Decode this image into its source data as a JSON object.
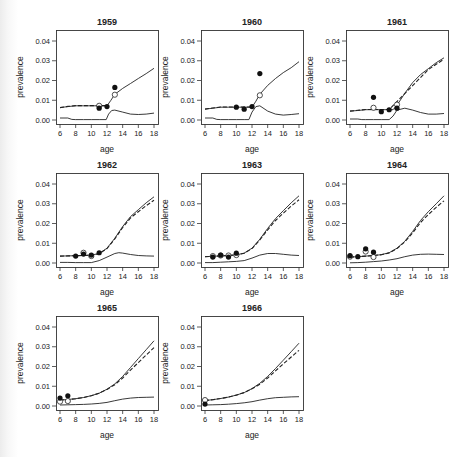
{
  "figure": {
    "xlabel": "age",
    "ylabel": "prevalence",
    "x_ticks": [
      6,
      8,
      10,
      12,
      14,
      16,
      18
    ],
    "y_ticks": [
      "0.00",
      "0.01",
      "0.02",
      "0.03",
      "0.04"
    ],
    "xlim": [
      6,
      18
    ],
    "ylim": [
      0,
      0.04
    ]
  },
  "chart_data": [
    {
      "type": "line",
      "title": "1959",
      "series": [
        {
          "name": "model upper solid",
          "style": "solid",
          "x": [
            6,
            7,
            8,
            9,
            10,
            11,
            12,
            12.5,
            13,
            14,
            15,
            16,
            17,
            18
          ],
          "y": [
            0.0063,
            0.0068,
            0.0072,
            0.0072,
            0.0072,
            0.0072,
            0.0072,
            0.01,
            0.013,
            0.016,
            0.0185,
            0.021,
            0.0235,
            0.0262
          ]
        },
        {
          "name": "model upper dashed",
          "style": "dashed",
          "x": [
            6,
            7,
            8,
            9,
            10,
            11,
            12
          ],
          "y": [
            0.0063,
            0.0069,
            0.0073,
            0.0073,
            0.0073,
            0.0073,
            0.0073
          ]
        },
        {
          "name": "model lower solid",
          "style": "solid",
          "x": [
            6,
            7,
            7.5,
            8,
            9,
            10,
            11,
            11.9,
            12.2,
            12.6,
            13,
            14,
            15,
            16,
            17,
            18
          ],
          "y": [
            0.001,
            0.001,
            0.0003,
            0.0002,
            0.0002,
            0.0002,
            0.0002,
            0.0002,
            0.003,
            0.0048,
            0.005,
            0.004,
            0.003,
            0.0028,
            0.003,
            0.0035
          ]
        },
        {
          "name": "observed filled",
          "style": "filled",
          "x": [
            11,
            12,
            13
          ],
          "y": [
            0.006,
            0.0068,
            0.0165
          ]
        },
        {
          "name": "observed open",
          "style": "open",
          "x": [
            11,
            13
          ],
          "y": [
            0.0072,
            0.0128
          ]
        }
      ]
    },
    {
      "type": "line",
      "title": "1960",
      "series": [
        {
          "name": "model upper solid",
          "style": "solid",
          "x": [
            6,
            7,
            8,
            9,
            10,
            11,
            12,
            12.5,
            13,
            14,
            15,
            16,
            17,
            18
          ],
          "y": [
            0.0055,
            0.006,
            0.0065,
            0.0065,
            0.0065,
            0.0065,
            0.0065,
            0.0095,
            0.013,
            0.0175,
            0.021,
            0.024,
            0.0265,
            0.0295
          ]
        },
        {
          "name": "model upper dashed",
          "style": "dashed",
          "x": [
            6,
            7,
            8,
            9,
            10,
            11,
            12
          ],
          "y": [
            0.0055,
            0.0061,
            0.0066,
            0.0066,
            0.0066,
            0.0066,
            0.0066
          ]
        },
        {
          "name": "model lower solid",
          "style": "solid",
          "x": [
            6,
            7,
            7.5,
            8,
            9,
            10,
            11,
            11.6,
            12,
            12.5,
            13,
            14,
            15,
            16,
            17,
            18
          ],
          "y": [
            0.001,
            0.001,
            0.0003,
            0.0002,
            0.0002,
            0.0002,
            0.0002,
            0.0002,
            0.004,
            0.0068,
            0.0072,
            0.0045,
            0.003,
            0.0025,
            0.0028,
            0.0032
          ]
        },
        {
          "name": "observed filled",
          "style": "filled",
          "x": [
            10,
            11,
            12,
            13
          ],
          "y": [
            0.0065,
            0.0055,
            0.0068,
            0.0235
          ]
        },
        {
          "name": "observed open",
          "style": "open",
          "x": [
            13
          ],
          "y": [
            0.0125
          ]
        }
      ]
    },
    {
      "type": "line",
      "title": "1961",
      "series": [
        {
          "name": "model upper solid",
          "style": "solid",
          "x": [
            6,
            7,
            8,
            9,
            10,
            11,
            11.5,
            12,
            13,
            14,
            15,
            16,
            17,
            18
          ],
          "y": [
            0.0045,
            0.0048,
            0.0052,
            0.0052,
            0.0052,
            0.0052,
            0.0052,
            0.0075,
            0.0135,
            0.019,
            0.023,
            0.026,
            0.029,
            0.0315
          ]
        },
        {
          "name": "model upper dashed",
          "style": "dashed",
          "x": [
            6,
            7,
            8,
            9,
            10,
            11,
            16,
            17,
            18
          ],
          "y": [
            0.0045,
            0.0049,
            0.0053,
            0.0053,
            0.0053,
            0.0053,
            0.0255,
            0.0282,
            0.0308
          ]
        },
        {
          "name": "model lower solid",
          "style": "solid",
          "x": [
            6,
            7,
            7.5,
            8,
            9,
            10,
            11,
            11.5,
            12,
            13,
            14,
            15,
            16,
            17,
            18
          ],
          "y": [
            0.0005,
            0.0005,
            0.0002,
            0.0002,
            0.0002,
            0.0002,
            0.0002,
            0.002,
            0.005,
            0.006,
            0.005,
            0.0038,
            0.003,
            0.003,
            0.0033
          ]
        },
        {
          "name": "observed filled",
          "style": "filled",
          "x": [
            9,
            10,
            11,
            12
          ],
          "y": [
            0.0115,
            0.0042,
            0.0052,
            0.006
          ]
        },
        {
          "name": "observed open",
          "style": "open",
          "x": [
            9,
            12
          ],
          "y": [
            0.0062,
            0.0078
          ]
        }
      ]
    },
    {
      "type": "line",
      "title": "1962",
      "series": [
        {
          "name": "model upper solid",
          "style": "solid",
          "x": [
            6,
            7,
            8,
            9,
            10,
            11,
            12,
            13,
            14,
            15,
            16,
            17,
            18
          ],
          "y": [
            0.0035,
            0.0036,
            0.0037,
            0.0038,
            0.004,
            0.0048,
            0.0075,
            0.0125,
            0.0185,
            0.0235,
            0.027,
            0.0305,
            0.0335
          ]
        },
        {
          "name": "model upper dashed",
          "style": "dashed",
          "x": [
            6,
            7,
            8,
            9,
            10,
            11,
            12,
            13,
            14,
            15,
            16,
            17,
            18
          ],
          "y": [
            0.0035,
            0.0036,
            0.0037,
            0.0038,
            0.004,
            0.0047,
            0.0073,
            0.0122,
            0.018,
            0.0228,
            0.026,
            0.029,
            0.0318
          ]
        },
        {
          "name": "model lower solid",
          "style": "solid",
          "x": [
            6,
            7,
            8,
            9,
            10,
            11,
            12,
            13,
            13.5,
            14,
            15,
            16,
            17,
            18
          ],
          "y": [
            0.0003,
            0.0003,
            0.0002,
            0.0002,
            0.0002,
            0.0012,
            0.003,
            0.0048,
            0.0052,
            0.005,
            0.0043,
            0.0038,
            0.0036,
            0.0035
          ]
        },
        {
          "name": "observed filled",
          "style": "filled",
          "x": [
            8,
            9,
            10,
            11
          ],
          "y": [
            0.0035,
            0.0045,
            0.004,
            0.0052
          ]
        },
        {
          "name": "observed open",
          "style": "open",
          "x": [
            9,
            10
          ],
          "y": [
            0.0052,
            0.0035
          ]
        }
      ]
    },
    {
      "type": "line",
      "title": "1963",
      "series": [
        {
          "name": "model upper solid",
          "style": "solid",
          "x": [
            6,
            7,
            8,
            9,
            10,
            11,
            12,
            13,
            14,
            15,
            16,
            17,
            18
          ],
          "y": [
            0.0032,
            0.0034,
            0.0036,
            0.0038,
            0.0041,
            0.005,
            0.0075,
            0.012,
            0.0175,
            0.0225,
            0.0265,
            0.0305,
            0.034
          ]
        },
        {
          "name": "model upper dashed",
          "style": "dashed",
          "x": [
            6,
            7,
            8,
            9,
            10,
            11,
            12,
            13,
            14,
            15,
            16,
            17,
            18
          ],
          "y": [
            0.0032,
            0.0034,
            0.0036,
            0.0038,
            0.0041,
            0.0049,
            0.0073,
            0.0117,
            0.0168,
            0.0215,
            0.0252,
            0.0288,
            0.032
          ]
        },
        {
          "name": "model lower solid",
          "style": "solid",
          "x": [
            6,
            7,
            8,
            9,
            10,
            11,
            12,
            13,
            14,
            15,
            16,
            17,
            18
          ],
          "y": [
            0.0002,
            0.0002,
            0.0004,
            0.0006,
            0.0008,
            0.0012,
            0.0025,
            0.004,
            0.0048,
            0.0048,
            0.0044,
            0.004,
            0.0038
          ]
        },
        {
          "name": "observed filled",
          "style": "filled",
          "x": [
            7,
            8,
            9,
            10
          ],
          "y": [
            0.003,
            0.004,
            0.003,
            0.005
          ]
        },
        {
          "name": "observed open",
          "style": "open",
          "x": [
            7,
            8,
            9,
            10
          ],
          "y": [
            0.0035,
            0.0038,
            0.0038,
            0.004
          ]
        }
      ]
    },
    {
      "type": "line",
      "title": "1964",
      "series": [
        {
          "name": "model upper solid",
          "style": "solid",
          "x": [
            6,
            7,
            8,
            9,
            10,
            11,
            12,
            13,
            14,
            15,
            16,
            17,
            18
          ],
          "y": [
            0.003,
            0.0032,
            0.0035,
            0.0038,
            0.0042,
            0.0052,
            0.0075,
            0.011,
            0.016,
            0.0215,
            0.026,
            0.03,
            0.034
          ]
        },
        {
          "name": "model upper dashed",
          "style": "dashed",
          "x": [
            6,
            7,
            8,
            9,
            10,
            11,
            12,
            13,
            14,
            15,
            16,
            17,
            18
          ],
          "y": [
            0.003,
            0.0032,
            0.0035,
            0.0038,
            0.0042,
            0.0051,
            0.0073,
            0.0107,
            0.0153,
            0.0205,
            0.0245,
            0.0282,
            0.0315
          ]
        },
        {
          "name": "model lower solid",
          "style": "solid",
          "x": [
            6,
            7,
            8,
            9,
            10,
            11,
            12,
            13,
            14,
            15,
            16,
            17,
            18
          ],
          "y": [
            0.0001,
            0.0002,
            0.0004,
            0.0007,
            0.001,
            0.0015,
            0.0022,
            0.0032,
            0.004,
            0.0044,
            0.0045,
            0.0044,
            0.0043
          ]
        },
        {
          "name": "observed filled",
          "style": "filled",
          "x": [
            6,
            7,
            8,
            9
          ],
          "y": [
            0.0037,
            0.0032,
            0.0072,
            0.0055
          ]
        },
        {
          "name": "observed open",
          "style": "open",
          "x": [
            6,
            8,
            9
          ],
          "y": [
            0.0032,
            0.0058,
            0.003
          ]
        }
      ]
    },
    {
      "type": "line",
      "title": "1965",
      "series": [
        {
          "name": "model upper solid",
          "style": "solid",
          "x": [
            6,
            7,
            8,
            9,
            10,
            11,
            12,
            13,
            14,
            15,
            16,
            17,
            18
          ],
          "y": [
            0.003,
            0.0033,
            0.0037,
            0.0043,
            0.0052,
            0.0065,
            0.0085,
            0.0112,
            0.015,
            0.0195,
            0.024,
            0.0285,
            0.033
          ]
        },
        {
          "name": "model upper dashed",
          "style": "dashed",
          "x": [
            6,
            7,
            8,
            9,
            10,
            11,
            12,
            13,
            14,
            15,
            16,
            17,
            18
          ],
          "y": [
            0.003,
            0.0033,
            0.0037,
            0.0043,
            0.0052,
            0.0065,
            0.0084,
            0.0108,
            0.0142,
            0.0182,
            0.022,
            0.0258,
            0.0295
          ]
        },
        {
          "name": "model lower solid",
          "style": "solid",
          "x": [
            6,
            7,
            8,
            9,
            10,
            11,
            12,
            13,
            14,
            15,
            16,
            17,
            18
          ],
          "y": [
            0.0005,
            0.0006,
            0.0007,
            0.0008,
            0.001,
            0.0013,
            0.0018,
            0.0027,
            0.0035,
            0.004,
            0.0043,
            0.0044,
            0.0045
          ]
        },
        {
          "name": "observed filled",
          "style": "filled",
          "x": [
            6,
            7
          ],
          "y": [
            0.004,
            0.0052
          ]
        },
        {
          "name": "observed open",
          "style": "open",
          "x": [
            6,
            7
          ],
          "y": [
            0.0022,
            0.0025
          ]
        }
      ]
    },
    {
      "type": "line",
      "title": "1966",
      "series": [
        {
          "name": "model upper solid",
          "style": "solid",
          "x": [
            6,
            7,
            8,
            9,
            10,
            11,
            12,
            13,
            14,
            15,
            16,
            17,
            18
          ],
          "y": [
            0.0028,
            0.0032,
            0.0038,
            0.0045,
            0.0055,
            0.0068,
            0.0088,
            0.0115,
            0.015,
            0.019,
            0.0232,
            0.0275,
            0.0318
          ]
        },
        {
          "name": "model upper dashed",
          "style": "dashed",
          "x": [
            6,
            7,
            8,
            9,
            10,
            11,
            12,
            13,
            14,
            15,
            16,
            17,
            18
          ],
          "y": [
            0.0028,
            0.0032,
            0.0038,
            0.0045,
            0.0055,
            0.0068,
            0.0087,
            0.011,
            0.0142,
            0.0178,
            0.0213,
            0.0248,
            0.0282
          ]
        },
        {
          "name": "model lower solid",
          "style": "solid",
          "x": [
            6,
            7,
            8,
            9,
            10,
            11,
            12,
            13,
            14,
            15,
            16,
            17,
            18
          ],
          "y": [
            0.0005,
            0.0006,
            0.0007,
            0.0009,
            0.0012,
            0.0016,
            0.0022,
            0.003,
            0.0037,
            0.0042,
            0.0044,
            0.0046,
            0.0047
          ]
        },
        {
          "name": "observed filled",
          "style": "filled",
          "x": [
            6
          ],
          "y": [
            0.001
          ]
        },
        {
          "name": "observed open",
          "style": "open",
          "x": [
            6
          ],
          "y": [
            0.003
          ]
        }
      ]
    }
  ],
  "layout": {
    "panels": [
      {
        "left": 56,
        "top": 30
      },
      {
        "left": 201,
        "top": 30
      },
      {
        "left": 346,
        "top": 30
      },
      {
        "left": 56,
        "top": 173
      },
      {
        "left": 201,
        "top": 173
      },
      {
        "left": 346,
        "top": 173
      },
      {
        "left": 56,
        "top": 316
      },
      {
        "left": 201,
        "top": 316
      }
    ],
    "frame_w": 102,
    "frame_h": 94
  }
}
